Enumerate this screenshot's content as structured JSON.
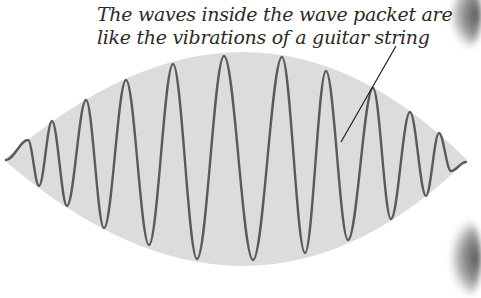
{
  "caption": {
    "line1": "The waves inside the wave packet are",
    "line2": "like the vibrations of a guitar string"
  },
  "colors": {
    "background": "#ffffff",
    "envelope_fill": "#dcdcdc",
    "wave_stroke": "#5a5a5a",
    "leader_line": "#1e1e1e",
    "text": "#2a2a2a"
  },
  "envelope": {
    "left_tip": [
      4,
      160
    ],
    "right_tip": [
      467,
      160
    ],
    "top_apex": [
      250,
      52
    ],
    "bottom_apex": [
      250,
      266
    ]
  },
  "wave": {
    "points": [
      [
        6,
        160
      ],
      [
        28,
        140
      ],
      [
        39,
        186
      ],
      [
        52,
        121
      ],
      [
        67,
        206
      ],
      [
        86,
        100
      ],
      [
        104,
        228
      ],
      [
        126,
        80
      ],
      [
        149,
        245
      ],
      [
        173,
        64
      ],
      [
        197,
        259
      ],
      [
        224,
        56
      ],
      [
        253,
        260
      ],
      [
        282,
        57
      ],
      [
        305,
        253
      ],
      [
        326,
        71
      ],
      [
        348,
        240
      ],
      [
        373,
        88
      ],
      [
        391,
        219
      ],
      [
        410,
        112
      ],
      [
        426,
        196
      ],
      [
        439,
        133
      ],
      [
        451,
        171
      ],
      [
        466,
        162
      ]
    ]
  },
  "leader_line": {
    "from": [
      396,
      46
    ],
    "to": [
      341,
      142
    ]
  }
}
